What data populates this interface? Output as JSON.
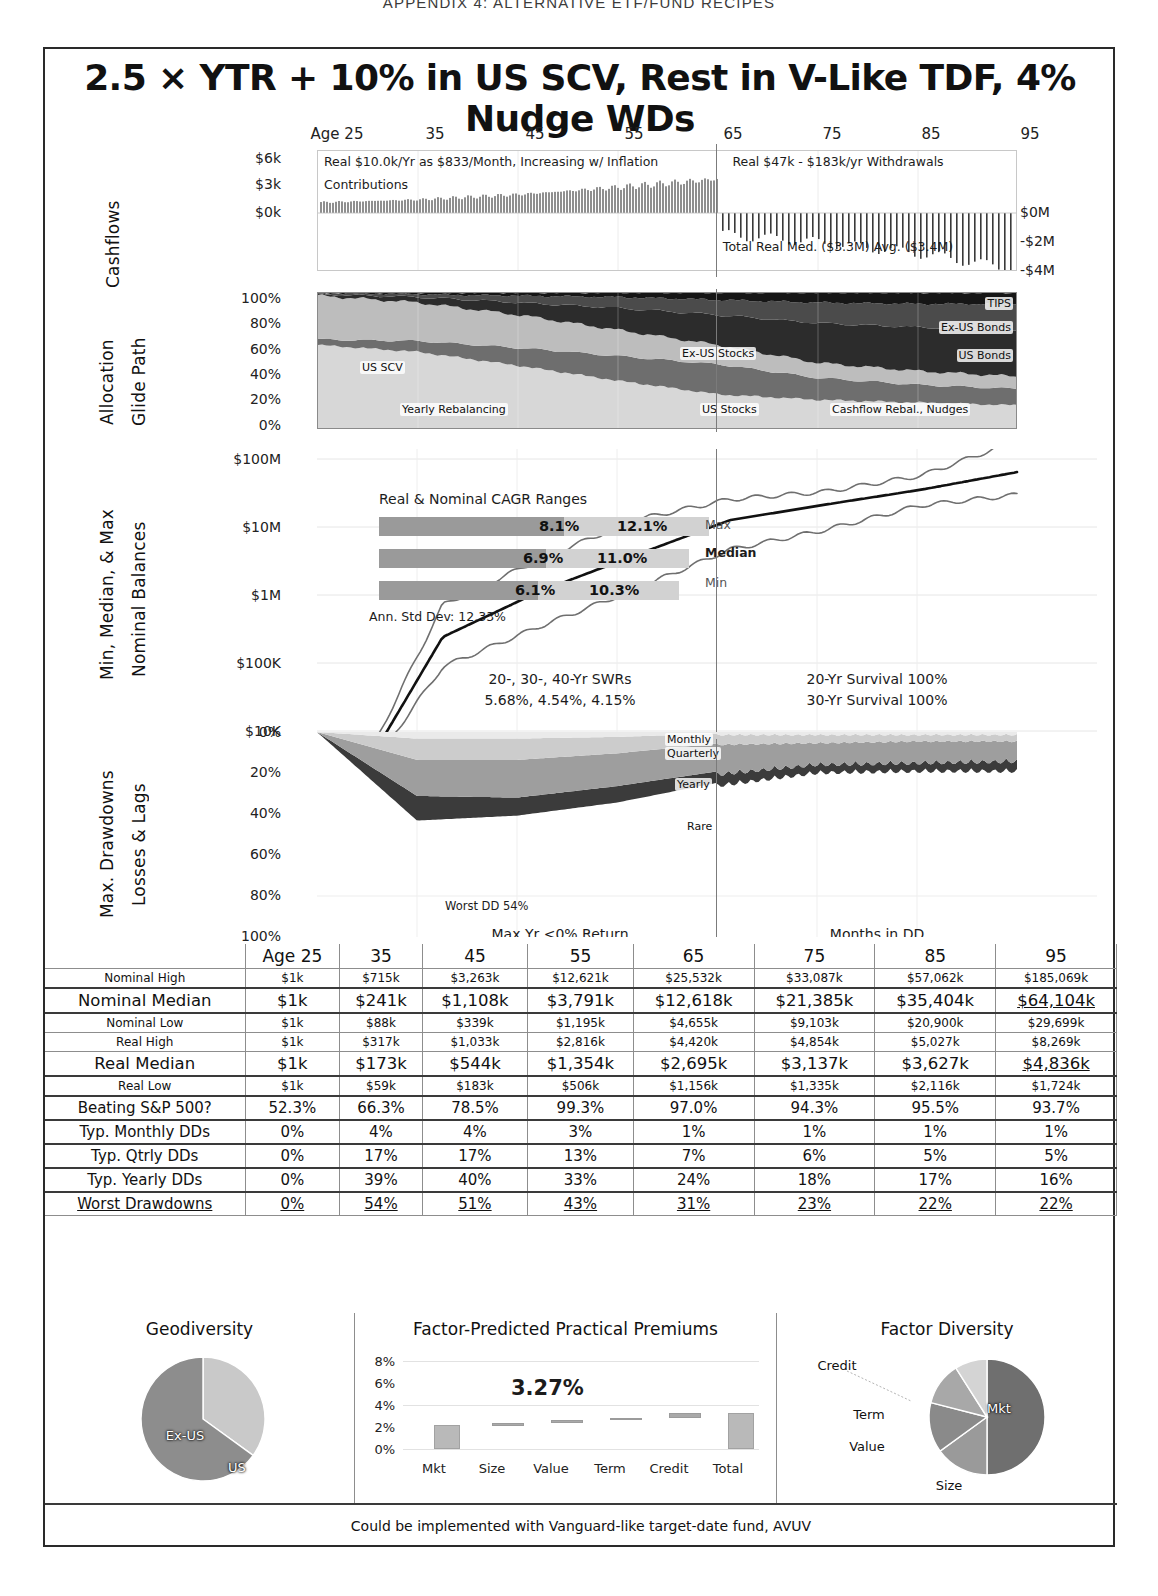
{
  "page_header": "APPENDIX 4: ALTERNATIVE ETF/FUND RECIPES",
  "title": "2.5 × YTR + 10% in US SCV, Rest in V-Like TDF, 4% Nudge WDs",
  "footer": "Could be implemented with Vanguard-like target-date fund, AVUV",
  "age_axis": {
    "ticks": [
      "Age 25",
      "35",
      "45",
      "55",
      "65",
      "75",
      "85",
      "95"
    ]
  },
  "panels": {
    "cashflows": {
      "label": "Cashflows",
      "y_labels": [
        "$6k",
        "$3k",
        "$0k"
      ],
      "y_labels_right": [
        "$0M",
        "-$2M",
        "-$4M"
      ],
      "annotations": {
        "contrib_header": "Real $10.0k/Yr as $833/Month, Increasing w/ Inflation",
        "contrib_word": "Contributions",
        "withdrawals": "Real $47k - $183k/yr Withdrawals",
        "totals": "Total Real Med. ($3.3M) Avg. ($3.4M)"
      }
    },
    "glidepath": {
      "label_top": "Allocation",
      "label_bottom": "Glide Path",
      "y_labels": [
        "100%",
        "80%",
        "60%",
        "40%",
        "20%",
        "0%"
      ],
      "series_labels": [
        "TIPS",
        "Ex-US Bonds",
        "US Bonds",
        "Ex-US Stocks",
        "US Stocks",
        "US SCV"
      ],
      "notes": [
        "Yearly Rebalancing",
        "Cashflow Rebal., Nudges"
      ]
    },
    "balances": {
      "label_top": "Min, Median, & Max",
      "label_bottom": "Nominal Balances",
      "y_labels": [
        "$100M",
        "$10M",
        "$1M",
        "$100K",
        "$10K"
      ],
      "cagr_title": "Real & Nominal CAGR Ranges",
      "cagr_rows": [
        {
          "name": "Max",
          "real": "8.1%",
          "nominal": "12.1%"
        },
        {
          "name": "Median",
          "real": "6.9%",
          "nominal": "11.0%"
        },
        {
          "name": "Min",
          "real": "6.1%",
          "nominal": "10.3%"
        }
      ],
      "std_dev": "Ann. Std Dev: 12.33%",
      "curve_labels": [
        "Max",
        "Median",
        "Min"
      ],
      "swr_title": "20-, 30-, 40-Yr SWRs",
      "swr_values": "5.68%, 4.54%, 4.15%",
      "survival": [
        "20-Yr Survival 100%",
        "30-Yr Survival 100%"
      ]
    },
    "drawdowns": {
      "label_top": "Max. Drawdowns",
      "label_bottom": "Losses & Lags",
      "y_labels": [
        "0%",
        "20%",
        "40%",
        "60%",
        "80%",
        "100%"
      ],
      "band_labels": [
        "Monthly",
        "Quarterly",
        "Yearly",
        "Rare"
      ],
      "worst_dd": "Worst DD 54%",
      "maxyr_title": "Max Yr <0% Return",
      "maxyr_values": "0.0 - 3.9 - 14.8",
      "months_title": "Months in DD",
      "months_values": "52% - 55% - 60%"
    }
  },
  "table": {
    "header": [
      "Age 25",
      "35",
      "45",
      "55",
      "65",
      "75",
      "85",
      "95"
    ],
    "rows": [
      {
        "label": "Nominal High",
        "size": "sm",
        "values": [
          "$1k",
          "$715k",
          "$3,263k",
          "$12,621k",
          "$25,532k",
          "$33,087k",
          "$57,062k",
          "$185,069k"
        ]
      },
      {
        "label": "Nominal Median",
        "size": "lg",
        "values": [
          "$1k",
          "$241k",
          "$1,108k",
          "$3,791k",
          "$12,618k",
          "$21,385k",
          "$35,404k",
          "$64,104k"
        ],
        "underline_last": true
      },
      {
        "label": "Nominal Low",
        "size": "sm",
        "values": [
          "$1k",
          "$88k",
          "$339k",
          "$1,195k",
          "$4,655k",
          "$9,103k",
          "$20,900k",
          "$29,699k"
        ]
      },
      {
        "label": "Real High",
        "size": "sm",
        "values": [
          "$1k",
          "$317k",
          "$1,033k",
          "$2,816k",
          "$4,420k",
          "$4,854k",
          "$5,027k",
          "$8,269k"
        ]
      },
      {
        "label": "Real Median",
        "size": "lg",
        "values": [
          "$1k",
          "$173k",
          "$544k",
          "$1,354k",
          "$2,695k",
          "$3,137k",
          "$3,627k",
          "$4,836k"
        ],
        "underline_last": true
      },
      {
        "label": "Real Low",
        "size": "sm",
        "values": [
          "$1k",
          "$59k",
          "$183k",
          "$506k",
          "$1,156k",
          "$1,335k",
          "$2,116k",
          "$1,724k"
        ]
      },
      {
        "label": "Beating S&P 500?",
        "size": "md",
        "values": [
          "52.3%",
          "66.3%",
          "78.5%",
          "99.3%",
          "97.0%",
          "94.3%",
          "95.5%",
          "93.7%"
        ]
      },
      {
        "label": "Typ. Monthly DDs",
        "size": "md",
        "values": [
          "0%",
          "4%",
          "4%",
          "3%",
          "1%",
          "1%",
          "1%",
          "1%"
        ]
      },
      {
        "label": "Typ. Qtrly DDs",
        "size": "md",
        "values": [
          "0%",
          "17%",
          "17%",
          "13%",
          "7%",
          "6%",
          "5%",
          "5%"
        ]
      },
      {
        "label": "Typ. Yearly DDs",
        "size": "md",
        "values": [
          "0%",
          "39%",
          "40%",
          "33%",
          "24%",
          "18%",
          "17%",
          "16%"
        ]
      },
      {
        "label": "Worst Drawdowns",
        "size": "md",
        "values": [
          "0%",
          "54%",
          "51%",
          "43%",
          "31%",
          "23%",
          "22%",
          "22%"
        ],
        "underline_all": true
      }
    ]
  },
  "bottom": {
    "geodiversity": {
      "title": "Geodiversity",
      "labels": [
        "Ex-US",
        "US"
      ],
      "values": [
        35,
        65
      ]
    },
    "premiums": {
      "title": "Factor-Predicted Practical Premiums",
      "total_label": "3.27%",
      "y_labels": [
        "8%",
        "6%",
        "4%",
        "2%",
        "0%"
      ],
      "categories": [
        "Mkt",
        "Size",
        "Value",
        "Term",
        "Credit",
        "Total"
      ],
      "increments": [
        2.2,
        0.15,
        0.25,
        0.23,
        0.44,
        3.27
      ]
    },
    "factor_diversity": {
      "title": "Factor Diversity",
      "labels": [
        "Mkt",
        "Size",
        "Value",
        "Term",
        "Credit"
      ],
      "values": [
        50,
        15,
        14,
        12,
        9
      ]
    }
  },
  "chart_data": [
    {
      "type": "area",
      "title": "Cashflows",
      "xlabel": "Age",
      "ylabel": "Annual Cashflow",
      "x": [
        25,
        35,
        45,
        55,
        65,
        75,
        85,
        95
      ],
      "ylim_left": [
        0,
        6
      ],
      "ylim_right": [
        -4,
        0
      ],
      "series": [
        {
          "name": "Contributions",
          "values": [
            0.83,
            1.1,
            1.6,
            2.3,
            3.1,
            0,
            0,
            0
          ]
        },
        {
          "name": "Withdrawals",
          "values": [
            0,
            0,
            0,
            0,
            -0.6,
            -1.2,
            -2.0,
            -3.2
          ]
        }
      ],
      "annotations": [
        "Real $10.0k/Yr as $833/Month, Increasing w/ Inflation",
        "Real $47k - $183k/yr Withdrawals",
        "Total Real Med. ($3.3M) Avg. ($3.4M)"
      ]
    },
    {
      "type": "area",
      "title": "Allocation Glide Path",
      "xlabel": "Age",
      "ylabel": "Allocation %",
      "categories": [
        25,
        35,
        45,
        55,
        65,
        75,
        85,
        95
      ],
      "ylim": [
        0,
        100
      ],
      "series": [
        {
          "name": "US SCV",
          "values": [
            62,
            57,
            47,
            36,
            26,
            22,
            20,
            18
          ]
        },
        {
          "name": "US Stocks",
          "values": [
            4,
            8,
            13,
            18,
            22,
            16,
            13,
            12
          ]
        },
        {
          "name": "Ex-US Stocks",
          "values": [
            32,
            28,
            24,
            19,
            14,
            11,
            10,
            9
          ]
        },
        {
          "name": "US Bonds",
          "values": [
            1,
            4,
            9,
            16,
            22,
            29,
            32,
            34
          ]
        },
        {
          "name": "Ex-US Bonds",
          "values": [
            1,
            2,
            5,
            8,
            11,
            15,
            17,
            19
          ]
        },
        {
          "name": "TIPS",
          "values": [
            0,
            1,
            2,
            3,
            5,
            7,
            8,
            8
          ]
        }
      ]
    },
    {
      "type": "line",
      "title": "Min, Median, & Max Nominal Balances",
      "xlabel": "Age",
      "ylabel": "Balance (log)",
      "x": [
        25,
        35,
        45,
        55,
        65,
        75,
        85,
        95
      ],
      "ylim": [
        10000,
        100000000
      ],
      "log_y": true,
      "series": [
        {
          "name": "Max",
          "values": [
            1000,
            715000,
            3263000,
            12621000,
            25532000,
            33087000,
            57062000,
            185069000
          ]
        },
        {
          "name": "Median",
          "values": [
            1000,
            241000,
            1108000,
            3791000,
            12618000,
            21385000,
            35404000,
            64104000
          ]
        },
        {
          "name": "Min",
          "values": [
            1000,
            88000,
            339000,
            1195000,
            4655000,
            9103000,
            20900000,
            29699000
          ]
        }
      ],
      "annotations": {
        "cagr": [
          {
            "name": "Max",
            "real": 8.1,
            "nominal": 12.1
          },
          {
            "name": "Median",
            "real": 6.9,
            "nominal": 11.0
          },
          {
            "name": "Min",
            "real": 6.1,
            "nominal": 10.3
          }
        ],
        "ann_std_dev": 12.33,
        "swr": {
          "20yr": 5.68,
          "30yr": 4.54,
          "40yr": 4.15
        },
        "survival": {
          "20yr": 100,
          "30yr": 100
        }
      }
    },
    {
      "type": "area",
      "title": "Max. Drawdowns, Losses & Lags",
      "xlabel": "Age",
      "ylabel": "Drawdown %",
      "x": [
        25,
        35,
        45,
        55,
        65,
        75,
        85,
        95
      ],
      "ylim": [
        0,
        100
      ],
      "inverted_y": true,
      "series": [
        {
          "name": "Monthly",
          "values": [
            0,
            4,
            4,
            3,
            1,
            1,
            1,
            1
          ]
        },
        {
          "name": "Quarterly",
          "values": [
            0,
            17,
            17,
            13,
            7,
            6,
            5,
            5
          ]
        },
        {
          "name": "Yearly",
          "values": [
            0,
            39,
            40,
            33,
            24,
            18,
            17,
            16
          ]
        },
        {
          "name": "Rare",
          "values": [
            0,
            54,
            51,
            43,
            31,
            23,
            22,
            22
          ]
        }
      ],
      "annotations": {
        "worst_dd": 54,
        "max_yr_negative": [
          0.0,
          3.9,
          14.8
        ],
        "months_in_dd": [
          52,
          55,
          60
        ]
      }
    },
    {
      "type": "pie",
      "title": "Geodiversity",
      "labels": [
        "Ex-US",
        "US"
      ],
      "values": [
        35,
        65
      ]
    },
    {
      "type": "bar",
      "title": "Factor-Predicted Practical Premiums",
      "categories": [
        "Mkt",
        "Size",
        "Value",
        "Term",
        "Credit",
        "Total"
      ],
      "values": [
        2.2,
        0.15,
        0.25,
        0.23,
        0.44,
        3.27
      ],
      "ylim": [
        0,
        8
      ],
      "ylabel": "",
      "xlabel": "",
      "data_label": "3.27%"
    },
    {
      "type": "pie",
      "title": "Factor Diversity",
      "labels": [
        "Mkt",
        "Size",
        "Value",
        "Term",
        "Credit"
      ],
      "values": [
        50,
        15,
        14,
        12,
        9
      ]
    }
  ]
}
